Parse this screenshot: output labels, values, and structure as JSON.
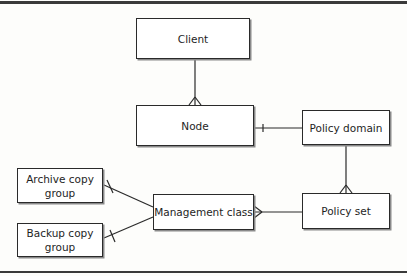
{
  "diagram": {
    "type": "entity-relationship",
    "entities": [
      {
        "id": "client",
        "label": "Client"
      },
      {
        "id": "node",
        "label": "Node"
      },
      {
        "id": "policy_domain",
        "label": "Policy domain"
      },
      {
        "id": "policy_set",
        "label": "Policy set"
      },
      {
        "id": "management_class",
        "label": "Management class"
      },
      {
        "id": "archive_copy_group",
        "label": "Archive copy group"
      },
      {
        "id": "backup_copy_group",
        "label": "Backup copy group"
      }
    ],
    "relationships": [
      {
        "from": "client",
        "to": "node",
        "from_end": "one",
        "to_end": "many"
      },
      {
        "from": "policy_domain",
        "to": "node",
        "from_end": "one",
        "to_end": "one"
      },
      {
        "from": "policy_domain",
        "to": "policy_set",
        "from_end": "one",
        "to_end": "many"
      },
      {
        "from": "policy_set",
        "to": "management_class",
        "from_end": "one",
        "to_end": "many"
      },
      {
        "from": "management_class",
        "to": "archive_copy_group",
        "from_end": "one",
        "to_end": "one"
      },
      {
        "from": "management_class",
        "to": "backup_copy_group",
        "from_end": "one",
        "to_end": "one"
      }
    ],
    "colors": {
      "line": "#2a2a2a",
      "box_fill": "#ffffff",
      "background": "#fdfdfb"
    }
  }
}
